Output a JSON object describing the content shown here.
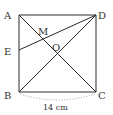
{
  "diagram": {
    "type": "geometry",
    "shape": "square ABCD with diagonals AC and BD and segment ED",
    "colors": {
      "line": "#2a2a2a",
      "label": "#333333",
      "dimension_arc": "#999999",
      "background": "#ffffff"
    },
    "points": {
      "A": {
        "label": "A",
        "x": 19,
        "y": 15
      },
      "D": {
        "label": "D",
        "x": 96,
        "y": 15
      },
      "B": {
        "label": "B",
        "x": 19,
        "y": 92
      },
      "C": {
        "label": "C",
        "x": 96,
        "y": 92
      },
      "E": {
        "label": "E",
        "x": 19,
        "y": 50
      },
      "M": {
        "label": "M",
        "x": 42,
        "y": 39
      },
      "O": {
        "label": "O",
        "x": 57,
        "y": 54
      }
    },
    "segments": [
      "AB",
      "BC",
      "CD",
      "DA",
      "AC",
      "BD",
      "ED"
    ],
    "dimension": {
      "between": "B-C",
      "label": "14 cm"
    }
  }
}
